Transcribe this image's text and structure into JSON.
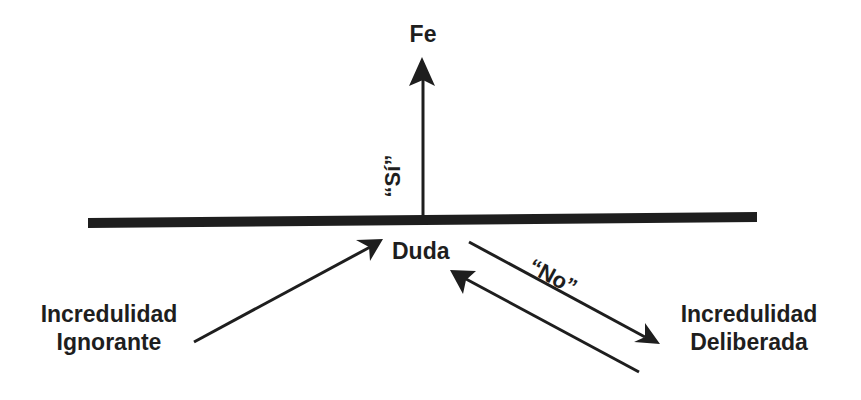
{
  "diagram": {
    "colors": {
      "ink": "#1e1e1e",
      "background": "#ffffff"
    },
    "nodes": {
      "top": {
        "label": "Fe"
      },
      "center": {
        "label": "Duda"
      },
      "left": {
        "line1": "Incredulidad",
        "line2": "Ignorante"
      },
      "right": {
        "line1": "Incredulidad",
        "line2": "Deliberada"
      }
    },
    "edge_labels": {
      "yes": "“Sí”",
      "no": "“No”"
    },
    "edges": [
      {
        "from": "Duda",
        "to": "Fe",
        "label": "“Sí”"
      },
      {
        "from": "Incredulidad Ignorante",
        "to": "Duda"
      },
      {
        "from": "Duda",
        "to": "Incredulidad Deliberada",
        "label": "“No”"
      },
      {
        "from": "Incredulidad Deliberada",
        "to": "Duda"
      }
    ]
  }
}
